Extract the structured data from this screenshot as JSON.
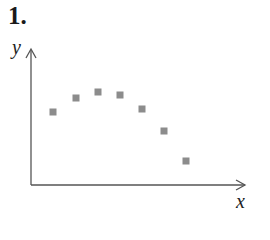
{
  "problem_number": "1.",
  "chart_data": {
    "type": "scatter",
    "title": "",
    "xlabel": "x",
    "ylabel": "y",
    "axis_ticks": "none",
    "grid": false,
    "legend": "none",
    "marker": "square",
    "marker_color": "#8c8c8c",
    "axis_color": "#555555",
    "points_pixel": [
      [
        53,
        112
      ],
      [
        76,
        98
      ],
      [
        98,
        92
      ],
      [
        120,
        95
      ],
      [
        142,
        109
      ],
      [
        164,
        131
      ],
      [
        186,
        161
      ]
    ],
    "x": [
      1,
      2,
      3,
      4,
      5,
      6,
      7
    ],
    "y": [
      5.3,
      6.3,
      6.7,
      6.5,
      5.5,
      3.9,
      1.7
    ],
    "note": "No numeric ticks shown; values are relative estimates with the origin at the axes intersection. The pattern rises, peaks, then falls (concave down)."
  }
}
